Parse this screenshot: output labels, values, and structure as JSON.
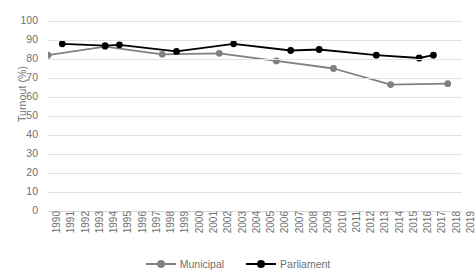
{
  "chart_data": {
    "type": "line",
    "title": "",
    "xlabel": "",
    "ylabel": "Turnout (%)",
    "ylim": [
      0,
      100
    ],
    "ytick_step": 10,
    "yticks": [
      100,
      90,
      80,
      70,
      60,
      50,
      40,
      30,
      20,
      10,
      0
    ],
    "grid": true,
    "legend_position": "bottom",
    "x": [
      1990,
      1991,
      1992,
      1993,
      1994,
      1995,
      1996,
      1997,
      1998,
      1999,
      2000,
      2001,
      2002,
      2003,
      2004,
      2005,
      2006,
      2007,
      2008,
      2009,
      2010,
      2011,
      2012,
      2013,
      2014,
      2015,
      2016,
      2017,
      2018,
      2019
    ],
    "xtick_labels": [
      "1990",
      "1991",
      "1992",
      "1993",
      "1994",
      "1995",
      "1996",
      "1997",
      "1998",
      "1999",
      "2000",
      "2001",
      "2002",
      "2003",
      "2004",
      "2005",
      "2006",
      "2007",
      "2008",
      "2009",
      "2010",
      "2011",
      "2012",
      "2013",
      "2014",
      "2015",
      "2016",
      "2017",
      "2018",
      "2019"
    ],
    "series": [
      {
        "name": "Municipal",
        "color": "#808080",
        "marker": "circle",
        "points": [
          {
            "x": 1990,
            "y": 82
          },
          {
            "x": 1994,
            "y": 86.5
          },
          {
            "x": 1998,
            "y": 82.5
          },
          {
            "x": 2002,
            "y": 83
          },
          {
            "x": 2006,
            "y": 79
          },
          {
            "x": 2010,
            "y": 75
          },
          {
            "x": 2014,
            "y": 66.5
          },
          {
            "x": 2018,
            "y": 67
          }
        ]
      },
      {
        "name": "Parliament",
        "color": "#000000",
        "marker": "circle",
        "points": [
          {
            "x": 1991,
            "y": 88
          },
          {
            "x": 1994,
            "y": 87
          },
          {
            "x": 1995,
            "y": 87.5
          },
          {
            "x": 1999,
            "y": 84
          },
          {
            "x": 2003,
            "y": 88
          },
          {
            "x": 2007,
            "y": 84.5
          },
          {
            "x": 2009,
            "y": 85
          },
          {
            "x": 2013,
            "y": 82
          },
          {
            "x": 2016,
            "y": 80.5
          },
          {
            "x": 2017,
            "y": 82
          }
        ]
      }
    ]
  },
  "colors": {
    "municipal": "#808080",
    "parliament": "#000000",
    "gridline": "#e2e2e2",
    "text": "#707070",
    "background": "#ffffff"
  }
}
